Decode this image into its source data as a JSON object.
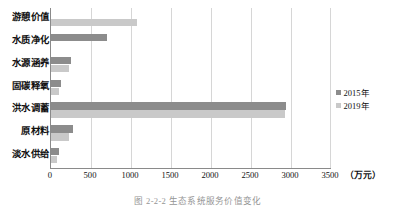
{
  "chart_data": {
    "type": "bar",
    "orientation": "horizontal",
    "title": "",
    "xlabel": "",
    "ylabel": "",
    "unit_label": "（万元）",
    "xlim": [
      0,
      3500
    ],
    "xticks": [
      0,
      500,
      1000,
      1500,
      2000,
      2500,
      3000,
      3500
    ],
    "xtick_labels": [
      "0",
      "500",
      "1000",
      "1500",
      "2000",
      "2500",
      "3000",
      "3500"
    ],
    "grid": "vertical",
    "legend_position": "right",
    "categories": [
      "游憩价值",
      "水质净化",
      "水源涵养",
      "固碳释氧",
      "洪水调蓄",
      "原材料",
      "淡水供给"
    ],
    "series": [
      {
        "name": "2015年",
        "color": "#8c8c8c",
        "values": [
          0,
          700,
          250,
          120,
          2940,
          270,
          100
        ]
      },
      {
        "name": "2019年",
        "color": "#c9c9c9",
        "values": [
          1080,
          0,
          230,
          95,
          2920,
          230,
          80
        ]
      }
    ]
  },
  "caption": {
    "text": "图 2-2-2   生态系统服务价值变化"
  }
}
